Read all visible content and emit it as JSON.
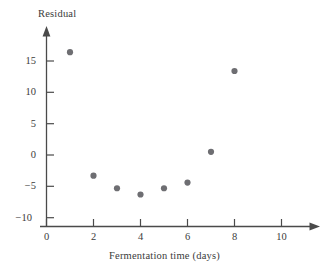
{
  "chart_data": {
    "type": "scatter",
    "title": "",
    "xlabel": "Fermentation time (days)",
    "ylabel": "Residual",
    "x": [
      1,
      2,
      3,
      4,
      5,
      6,
      7,
      8
    ],
    "values": [
      16.4,
      -3.3,
      -5.3,
      -6.3,
      -5.3,
      -4.4,
      0.5,
      13.4
    ],
    "series": [
      {
        "name": "Residual",
        "points": [
          {
            "x": 1,
            "y": 16.4
          },
          {
            "x": 2,
            "y": -3.3
          },
          {
            "x": 3,
            "y": -5.3
          },
          {
            "x": 4,
            "y": -6.3
          },
          {
            "x": 5,
            "y": -5.3
          },
          {
            "x": 6,
            "y": -4.4
          },
          {
            "x": 7,
            "y": 0.5
          },
          {
            "x": 8,
            "y": 13.4
          }
        ]
      }
    ],
    "xlim": [
      0,
      11.2
    ],
    "ylim": [
      -10,
      18.5
    ],
    "xticks": [
      0,
      2,
      4,
      6,
      8,
      10
    ],
    "xtick_labels": [
      "0",
      "2",
      "4",
      "6",
      "8",
      "10"
    ],
    "yticks": [
      15,
      10,
      5,
      0,
      -5,
      -10
    ],
    "ytick_labels": [
      "15",
      "10",
      "5",
      "0",
      "−5",
      "−10"
    ],
    "grid": false,
    "legend": "none",
    "marker": "filled-circle",
    "marker_color": "#6e6e72",
    "axis_color": "#4a4a4a",
    "axis_arrows": [
      "x-positive",
      "y-positive"
    ]
  },
  "axes": {
    "y_title": "Residual",
    "x_title": "Fermentation time (days)"
  }
}
